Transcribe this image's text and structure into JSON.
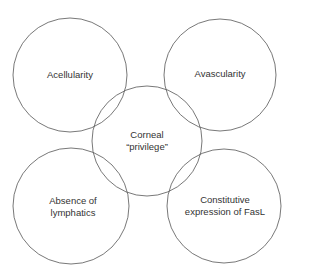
{
  "diagram": {
    "stroke_color": "#555555",
    "circles": [
      {
        "id": "acellularity",
        "cx": 70,
        "cy": 75,
        "r": 57,
        "lines": [
          "Acellularity"
        ]
      },
      {
        "id": "avascularity",
        "cx": 220,
        "cy": 75,
        "r": 56,
        "lines": [
          "Avascularity"
        ]
      },
      {
        "id": "corneal-privilege",
        "cx": 147,
        "cy": 141,
        "r": 55,
        "lines": [
          "Corneal",
          "“privilege”"
        ]
      },
      {
        "id": "absence-of-lymphatics",
        "cx": 71,
        "cy": 206,
        "r": 58,
        "lines": [
          "Absence of",
          "lymphatics"
        ]
      },
      {
        "id": "fasl",
        "cx": 224,
        "cy": 206,
        "r": 57,
        "lines": [
          "Constitutive",
          "expression of FasL"
        ]
      }
    ]
  }
}
